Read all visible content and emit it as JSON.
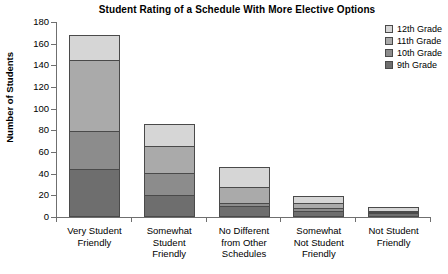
{
  "chart_data": {
    "type": "bar",
    "title": "Student Rating of a Schedule With More Elective Options",
    "xlabel": "",
    "ylabel": "Number of Students",
    "ylim": [
      0,
      180
    ],
    "yticks": [
      0,
      20,
      40,
      60,
      80,
      100,
      120,
      140,
      160,
      180
    ],
    "grid": false,
    "stacked": true,
    "legend_position": "top-right",
    "categories": [
      "Very Student Friendly",
      "Somewhat Student Friendly",
      "No Different from Other Schedules",
      "Somewhat Not Student Friendly",
      "Not Student Friendly"
    ],
    "category_lines": [
      [
        "Very Student",
        "Friendly"
      ],
      [
        "Somewhat",
        "Student",
        "Friendly"
      ],
      [
        "No Different",
        "from Other",
        "Schedules"
      ],
      [
        "Somewhat",
        "Not Student",
        "Friendly"
      ],
      [
        "Not Student",
        "Friendly"
      ]
    ],
    "series": [
      {
        "name": "9th Grade",
        "color": "#6e6e6e",
        "values": [
          43,
          19,
          9,
          4,
          2
        ]
      },
      {
        "name": "10th Grade",
        "color": "#8c8c8c",
        "values": [
          35,
          21,
          3,
          3,
          1
        ]
      },
      {
        "name": "11th Grade",
        "color": "#aaaaaa",
        "values": [
          67,
          25,
          15,
          5,
          1
        ]
      },
      {
        "name": "12th Grade",
        "color": "#d6d6d6",
        "values": [
          23,
          21,
          19,
          7,
          5
        ]
      }
    ],
    "totals": [
      168,
      86,
      46,
      19,
      9
    ]
  },
  "legend": {
    "items": [
      {
        "label": "12th Grade",
        "color": "#d6d6d6"
      },
      {
        "label": "11th Grade",
        "color": "#aaaaaa"
      },
      {
        "label": "10th Grade",
        "color": "#8c8c8c"
      },
      {
        "label": "9th Grade",
        "color": "#6e6e6e"
      }
    ]
  }
}
